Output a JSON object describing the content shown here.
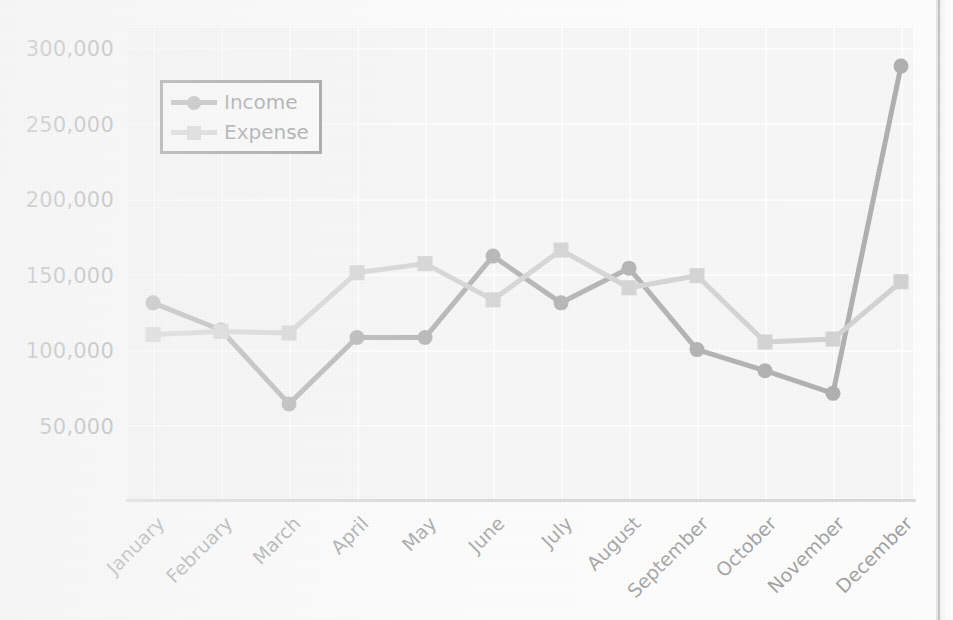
{
  "chart_data": {
    "type": "line",
    "title": "",
    "subtitle": "",
    "xlabel": "",
    "ylabel": "",
    "categories": [
      "January",
      "February",
      "March",
      "April",
      "May",
      "June",
      "July",
      "August",
      "September",
      "October",
      "November",
      "December"
    ],
    "series": [
      {
        "name": "Income",
        "color": "#5e5e5e",
        "marker": "circle",
        "values": [
          131000,
          113000,
          64000,
          108000,
          108000,
          162000,
          131000,
          154000,
          100000,
          86000,
          71000,
          288000
        ]
      },
      {
        "name": "Expense",
        "color": "#a6a6a6",
        "marker": "square",
        "values": [
          110000,
          112000,
          111000,
          151000,
          157000,
          133000,
          166000,
          141000,
          149000,
          105000,
          107000,
          145000
        ]
      }
    ],
    "ylim": [
      0,
      320000
    ],
    "yticks": [
      50000,
      100000,
      150000,
      200000,
      250000,
      300000
    ],
    "ytick_labels": [
      "50,000",
      "100,000",
      "150,000",
      "200,000",
      "250,000",
      "300,000"
    ],
    "grid": true,
    "grid_color": "#ffffff",
    "plot_background": "#f0f0f0",
    "legend_position": "upper left",
    "xtick_rotation": -45
  },
  "legend": {
    "income_label": "Income",
    "expense_label": "Expense"
  },
  "axis": {
    "y_labels": [
      "300,000",
      "250,000",
      "200,000",
      "150,000",
      "100,000",
      "50,000"
    ],
    "x_labels": [
      "January",
      "February",
      "March",
      "April",
      "May",
      "June",
      "July",
      "August",
      "September",
      "October",
      "November",
      "December"
    ]
  }
}
